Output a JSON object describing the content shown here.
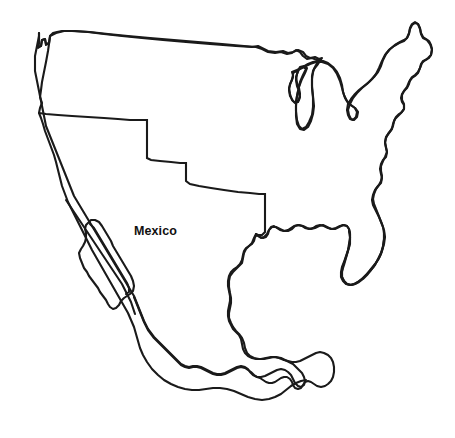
{
  "map": {
    "type": "outline-map",
    "title": "Outline map of the United States and Mexico",
    "background_color": "#ffffff",
    "stroke_color": "#1a1a1a",
    "stroke_width": 2.1,
    "width": 455,
    "height": 438,
    "labels": [
      {
        "name": "mexico-label",
        "text": "Mexico",
        "x": 134,
        "y": 235,
        "font_size": 12.5,
        "font_weight": "bold",
        "color": "#111111"
      }
    ],
    "regions": [
      {
        "name": "united-states-mainland",
        "label": "United States",
        "closed": true
      },
      {
        "name": "mexico-mainland",
        "label": "Mexico",
        "closed": true
      },
      {
        "name": "baja-california-peninsula",
        "label": "Baja California",
        "closed": true
      }
    ],
    "features": [
      "Puget Sound notch",
      "Pacific coastline",
      "Canadian border",
      "Great Lakes",
      "Lake Michigan",
      "Lake Huron",
      "Michigan thumb",
      "Maine northeast corner",
      "Atlantic coastline",
      "Cape Hatteras",
      "Florida peninsula",
      "Gulf of Mexico coast",
      "Rio Grande border",
      "US-Mexico stepped border",
      "Gulf of California",
      "Yucatan Peninsula"
    ]
  }
}
